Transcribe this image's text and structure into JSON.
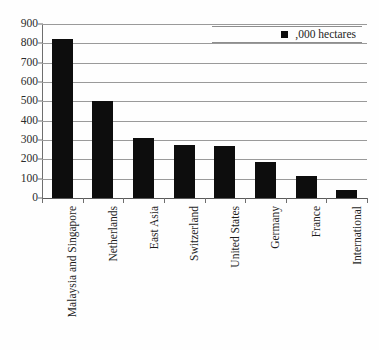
{
  "chart_data": {
    "type": "bar",
    "title": "",
    "subtitle": "",
    "xlabel": "",
    "ylabel": "",
    "ylim": [
      0,
      900
    ],
    "ytick_step": 100,
    "yticks": [
      0,
      100,
      200,
      300,
      400,
      500,
      600,
      700,
      800,
      900
    ],
    "ytick_labels": [
      "0",
      "100",
      "200",
      "300",
      "400",
      "500",
      "600",
      "700",
      "800",
      "900"
    ],
    "grid": true,
    "grid_axis": "y",
    "legend_position": "top-right",
    "categories": [
      "Malaysia and Singapore",
      "Netherlands",
      "East Asia",
      "Switzerland",
      "United States",
      "Germany",
      "France",
      "International"
    ],
    "series": [
      {
        "name": ",000 hectares",
        "color": "#0d0d0d",
        "values": [
          820,
          500,
          312,
          275,
          268,
          187,
          115,
          40
        ]
      }
    ],
    "annotations": []
  },
  "legend": {
    "entries": [
      {
        "label": ",000 hectares",
        "color": "#0d0d0d",
        "marker": "square"
      }
    ]
  },
  "colors": {
    "bar": "#0d0d0d",
    "gridline": "#9a9a9a",
    "axis": "#6e6e6e",
    "text": "#1d1d1d",
    "background": "#fefefe"
  }
}
